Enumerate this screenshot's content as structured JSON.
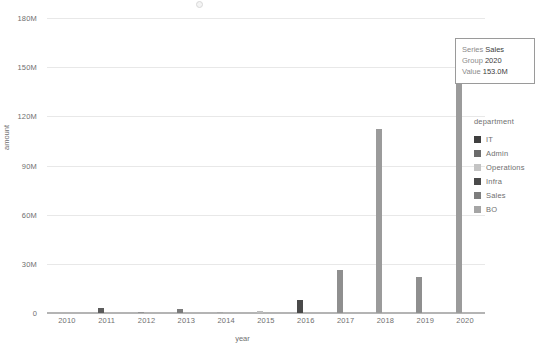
{
  "chart_data": {
    "type": "bar",
    "title": "",
    "xlabel": "year",
    "ylabel": "amount",
    "categories": [
      "2010",
      "2011",
      "2012",
      "2013",
      "2014",
      "2015",
      "2016",
      "2017",
      "2018",
      "2019",
      "2020"
    ],
    "values": [
      0,
      3.2,
      0.8,
      2.4,
      0.9,
      1.4,
      8.0,
      26.0,
      112.0,
      22.0,
      153.0
    ],
    "value_unit": "M",
    "ylim": [
      0,
      180
    ],
    "yticks": [
      0,
      30,
      60,
      90,
      120,
      150,
      180
    ],
    "ytick_labels": [
      "0",
      "30M",
      "60M",
      "90M",
      "120M",
      "150M",
      "180M"
    ],
    "xtick_labels": [
      "2010",
      "2011",
      "2012",
      "2013",
      "2014",
      "2015",
      "2016",
      "2017",
      "2018",
      "2019",
      "2020"
    ],
    "grid": true,
    "legend_position": "right",
    "bar_colors": [
      "#8a8a8a",
      "#5c5c5c",
      "#949494",
      "#7b7b7b",
      "#a8a8a8",
      "#bdbdbd",
      "#4a4a4a",
      "#8f8f8f",
      "#9b9b9b",
      "#8f8f8f",
      "#9b9b9b"
    ]
  },
  "legend": {
    "title": "department",
    "items": [
      {
        "label": "IT",
        "color": "#3f3f3f"
      },
      {
        "label": "Admin",
        "color": "#6b6b6b"
      },
      {
        "label": "Operations",
        "color": "#c4c4c4"
      },
      {
        "label": "Infra",
        "color": "#4a4a4a"
      },
      {
        "label": "Sales",
        "color": "#7d7d7d"
      },
      {
        "label": "BO",
        "color": "#a5a5a5"
      }
    ]
  },
  "tooltip": {
    "rows": [
      {
        "key": "Series",
        "value": "Sales"
      },
      {
        "key": "Group",
        "value": "2020"
      },
      {
        "key": "Value",
        "value": "153.0M"
      }
    ]
  },
  "colors": {
    "grid": "#e8e8e8",
    "axis": "#b4b4b4",
    "text": "#6f6f6f",
    "background": "#ffffff"
  }
}
